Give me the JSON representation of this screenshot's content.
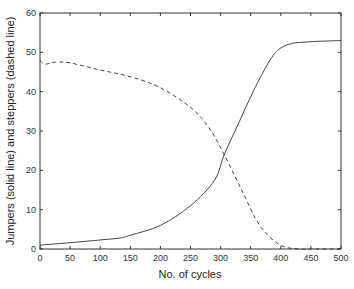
{
  "chart_data": {
    "type": "line",
    "title": "",
    "xlabel": "No. of cycles",
    "ylabel": "Jumpers (solid line) and steppers (dashed line)",
    "xlim": [
      0,
      500
    ],
    "ylim": [
      0,
      60
    ],
    "xticks": [
      0,
      50,
      100,
      150,
      200,
      250,
      300,
      350,
      400,
      450,
      500
    ],
    "yticks": [
      0,
      10,
      20,
      30,
      40,
      50,
      60
    ],
    "grid": false,
    "legend": null,
    "series": [
      {
        "name": "Jumpers",
        "style": "solid",
        "x": [
          0,
          50,
          100,
          133,
          150,
          200,
          250,
          290,
          306,
          330,
          354,
          382,
          399,
          420,
          440,
          460,
          480,
          500
        ],
        "y": [
          1,
          1.6,
          2.3,
          2.8,
          3.5,
          6,
          11,
          17.5,
          24,
          32,
          40,
          48,
          51,
          52.3,
          52.6,
          52.8,
          52.9,
          53
        ]
      },
      {
        "name": "Steppers",
        "style": "dashed",
        "x": [
          0,
          8,
          25,
          50,
          100,
          150,
          200,
          250,
          280,
          306,
          335,
          365,
          399,
          432,
          450,
          500
        ],
        "y": [
          48,
          47,
          47.5,
          47.3,
          45.5,
          43.8,
          41,
          36,
          31,
          24,
          15,
          6,
          1,
          0,
          0,
          0
        ]
      }
    ]
  }
}
